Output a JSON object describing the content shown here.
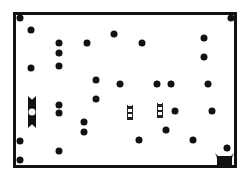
{
  "board": {
    "frame": {
      "left": 13,
      "top": 12,
      "right": 237,
      "bottom": 168
    },
    "colors": {
      "ink": "#111111",
      "background": "#ffffff"
    },
    "pegs": [
      {
        "x": 20,
        "y": 18
      },
      {
        "x": 31,
        "y": 30
      },
      {
        "x": 59,
        "y": 43
      },
      {
        "x": 59,
        "y": 53
      },
      {
        "x": 87,
        "y": 43
      },
      {
        "x": 114,
        "y": 34
      },
      {
        "x": 142,
        "y": 43
      },
      {
        "x": 231,
        "y": 18
      },
      {
        "x": 204,
        "y": 38
      },
      {
        "x": 204,
        "y": 57
      },
      {
        "x": 31,
        "y": 68
      },
      {
        "x": 59,
        "y": 66
      },
      {
        "x": 96,
        "y": 80
      },
      {
        "x": 120,
        "y": 84
      },
      {
        "x": 157,
        "y": 84
      },
      {
        "x": 171,
        "y": 84
      },
      {
        "x": 208,
        "y": 84
      },
      {
        "x": 96,
        "y": 99
      },
      {
        "x": 59,
        "y": 105
      },
      {
        "x": 59,
        "y": 113
      },
      {
        "x": 84,
        "y": 122
      },
      {
        "x": 84,
        "y": 132
      },
      {
        "x": 175,
        "y": 111
      },
      {
        "x": 212,
        "y": 111
      },
      {
        "x": 166,
        "y": 130
      },
      {
        "x": 139,
        "y": 140
      },
      {
        "x": 193,
        "y": 140
      },
      {
        "x": 20,
        "y": 141
      },
      {
        "x": 59,
        "y": 151
      },
      {
        "x": 20,
        "y": 160
      },
      {
        "x": 227,
        "y": 148
      }
    ],
    "gates": [
      {
        "x": 28,
        "y": 96,
        "w": 8,
        "h": 32
      }
    ],
    "ladders": [
      {
        "x": 127,
        "y": 105,
        "h": 15,
        "rungs": 3
      },
      {
        "x": 157,
        "y": 103,
        "h": 15,
        "rungs": 3
      }
    ],
    "cup": {
      "x": 215,
      "y": 153,
      "w": 19,
      "h": 13
    }
  }
}
